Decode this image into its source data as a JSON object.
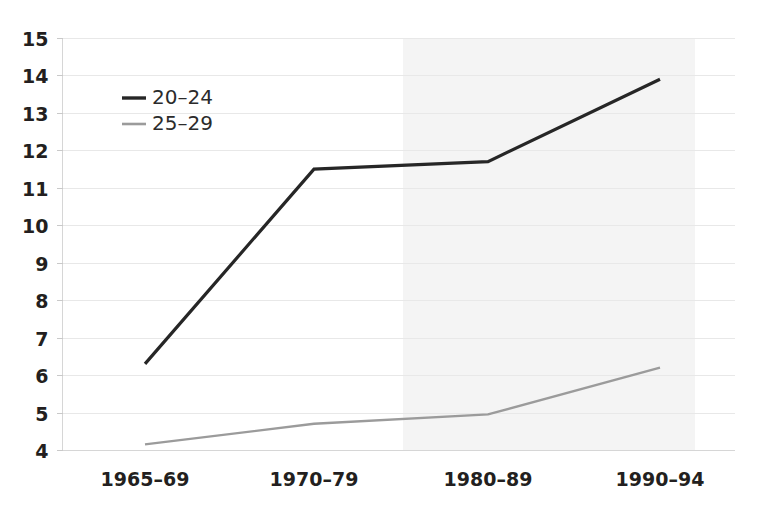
{
  "chart_data": {
    "type": "line",
    "title": "",
    "subtitle": "",
    "xlabel": "",
    "ylabel": "",
    "categories": [
      "1965–69",
      "1970–79",
      "1980–89",
      "1990–94"
    ],
    "yticks": [
      4,
      5,
      6,
      7,
      8,
      9,
      10,
      11,
      12,
      13,
      14,
      15
    ],
    "ylim": [
      4,
      15
    ],
    "grid": true,
    "legend_position": "upper-left-inside",
    "series": [
      {
        "name": "20–24",
        "values": [
          6.3,
          11.5,
          11.7,
          13.9
        ],
        "color": "#262626",
        "linewidth": 3.2
      },
      {
        "name": "25–29",
        "values": [
          4.15,
          4.7,
          4.95,
          6.2
        ],
        "color": "#9b9b9b",
        "linewidth": 2.4
      }
    ],
    "annotations": [
      {
        "type": "shaded-band",
        "label": "projection-band",
        "x_start_category_index": 1.5,
        "x_end_category_index": 3.2,
        "color": "#f4f4f4"
      }
    ]
  },
  "axes": {
    "y_tick_labels": [
      "15",
      "14",
      "13",
      "12",
      "11",
      "10",
      "9",
      "8",
      "7",
      "6",
      "5",
      "4"
    ],
    "x_tick_labels": [
      "1965–69",
      "1970–79",
      "1980–89",
      "1990–94"
    ]
  },
  "legend": {
    "entries": [
      {
        "label": "20–24",
        "color": "#262626"
      },
      {
        "label": "25–29",
        "color": "#9b9b9b"
      }
    ]
  },
  "colors": {
    "background": "#ffffff",
    "gridline": "#e8e8e8",
    "spine": "#d6d6d6",
    "text": "#231f20",
    "series_dark": "#262626",
    "series_gray": "#9b9b9b",
    "shade": "#f4f4f4"
  }
}
